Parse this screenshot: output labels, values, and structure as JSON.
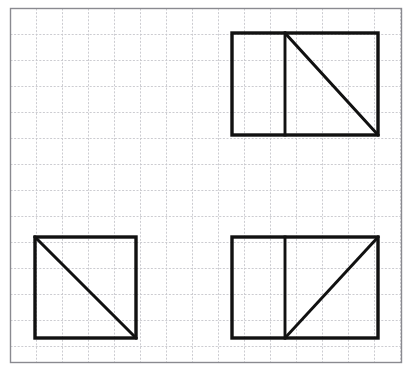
{
  "figure": {
    "title": "Grid with four right-triangle area figures",
    "canvas": {
      "width": 413,
      "height": 371,
      "background": "#ffffff"
    },
    "outer_border": {
      "name": "outer-border",
      "x": 10.5,
      "y": 8.5,
      "width": 391,
      "height": 354,
      "stroke": "#8a8a90",
      "stroke_width": 1.4
    },
    "grid": {
      "name": "graph-paper-grid",
      "cell_size": 26,
      "stroke": "#c6c6cc",
      "stroke_width": 0.9,
      "dash": "2 1.6",
      "columns": 15,
      "rows": 13,
      "origin_x": 10.5,
      "origin_y": 8.5,
      "extent_x": 401.5,
      "extent_y": 362.5
    },
    "shape_stroke": "#111111",
    "shape_stroke_width": 3.4,
    "shapes": [
      {
        "id": "top-right-figure",
        "label": "Rectangle with vertical divider and descending diagonal",
        "rect": {
          "x": 232,
          "y": 33,
          "width": 146,
          "height": 102
        },
        "cells": {
          "width": 5.6,
          "height": 3.9
        },
        "divider": {
          "orientation": "vertical",
          "x": 285,
          "y1": 33,
          "y2": 135
        },
        "diagonal": {
          "x1": 285,
          "y1": 33,
          "x2": 378,
          "y2": 135,
          "direction": "descending"
        }
      },
      {
        "id": "bottom-left-figure",
        "label": "Square with descending diagonal",
        "rect": {
          "x": 35,
          "y": 237,
          "width": 101,
          "height": 101
        },
        "cells": {
          "width": 3.9,
          "height": 3.9
        },
        "divider": null,
        "diagonal": {
          "x1": 35,
          "y1": 237,
          "x2": 136,
          "y2": 338,
          "direction": "descending"
        }
      },
      {
        "id": "bottom-right-figure",
        "label": "Rectangle with vertical divider and ascending diagonal",
        "rect": {
          "x": 232,
          "y": 237,
          "width": 146,
          "height": 101
        },
        "cells": {
          "width": 5.6,
          "height": 3.9
        },
        "divider": {
          "orientation": "vertical",
          "x": 285,
          "y1": 237,
          "y2": 338
        },
        "diagonal": {
          "x1": 285,
          "y1": 338,
          "x2": 378,
          "y2": 237,
          "direction": "ascending"
        }
      }
    ]
  }
}
